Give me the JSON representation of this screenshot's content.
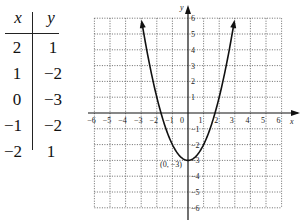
{
  "table": {
    "headers": {
      "x": "x",
      "y": "y"
    },
    "rows": [
      {
        "x": "2",
        "y": "1"
      },
      {
        "x": "1",
        "y": "−2"
      },
      {
        "x": "0",
        "y": "−3"
      },
      {
        "x": "−1",
        "y": "−2"
      },
      {
        "x": "−2",
        "y": "1"
      }
    ]
  },
  "graph": {
    "x_axis_label": "x",
    "y_axis_label": "y",
    "x_ticks": [
      "−6",
      "−5",
      "−4",
      "−3",
      "−2",
      "−1",
      "0",
      "1",
      "2",
      "3",
      "4",
      "5",
      "6"
    ],
    "y_ticks": [
      "6",
      "5",
      "4",
      "3",
      "2",
      "1",
      "−1",
      "−2",
      "−3",
      "−4",
      "−5",
      "−6"
    ],
    "vertex_label": "(0, −3)",
    "function": "y = x^2 - 3",
    "range": {
      "xmin": -6,
      "xmax": 6,
      "ymin": -6,
      "ymax": 6
    }
  }
}
